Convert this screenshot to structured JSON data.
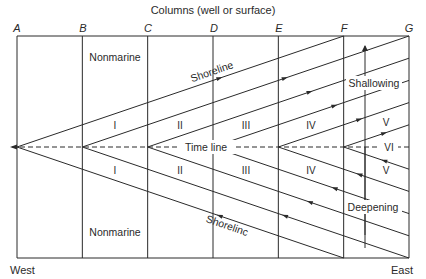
{
  "title": "Columns (well or surface)",
  "columns": [
    "A",
    "B",
    "C",
    "D",
    "E",
    "F",
    "G"
  ],
  "apex_columns": [
    "A",
    "B",
    "C",
    "D",
    "E",
    "F"
  ],
  "labels": {
    "nonmarine_top": "Nonmarine",
    "nonmarine_bottom": "Nonmarine",
    "shoreline_top": "Shoreline",
    "shoreline_bottom": "Shorelinc",
    "time_line": "Time line",
    "shallowing": "Shallowing",
    "deepening": "Deepening",
    "west": "West",
    "east": "East"
  },
  "units_upper": [
    "I",
    "II",
    "III",
    "IV",
    "V"
  ],
  "units_lower": [
    "I",
    "II",
    "III",
    "IV",
    "V"
  ],
  "unit_center": "VI",
  "colors": {
    "line": "#2a2a2a",
    "background": "#ffffff"
  }
}
